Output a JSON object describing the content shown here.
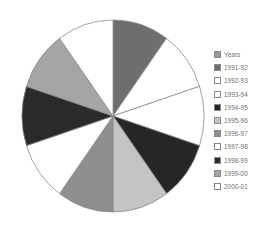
{
  "chart_data": {
    "type": "pie",
    "title": "",
    "legend_title": "Years",
    "legend_position": "right",
    "grid": false,
    "start_angle_deg": 0,
    "direction": "clockwise",
    "categories": [
      "1991-92",
      "1992-93",
      "1993-94",
      "1994-95",
      "1995-96",
      "1996-97",
      "1997-98",
      "1998-99",
      "1999-00",
      "2000-01"
    ],
    "values": [
      10,
      10,
      10,
      10,
      10,
      10,
      10,
      10,
      10,
      10
    ],
    "value_unit": "%",
    "slice_colors": [
      "#6e6e6e",
      "#ffffff",
      "#ffffff",
      "#262626",
      "#c4c4c4",
      "#8f8f8f",
      "#ffffff",
      "#2b2b2b",
      "#a5a5a5",
      "#ffffff"
    ],
    "slice_outline_color": "#8a8a8a",
    "slices": [
      {
        "label": "1991-92",
        "value": 10,
        "start_deg": 0,
        "end_deg": 36,
        "color": "#6e6e6e"
      },
      {
        "label": "1992-93",
        "value": 10,
        "start_deg": 36,
        "end_deg": 72,
        "color": "#ffffff"
      },
      {
        "label": "1993-94",
        "value": 10,
        "start_deg": 72,
        "end_deg": 108,
        "color": "#ffffff"
      },
      {
        "label": "1994-95",
        "value": 10,
        "start_deg": 108,
        "end_deg": 144,
        "color": "#262626"
      },
      {
        "label": "1995-96",
        "value": 10,
        "start_deg": 144,
        "end_deg": 180,
        "color": "#c4c4c4"
      },
      {
        "label": "1996-97",
        "value": 10,
        "start_deg": 180,
        "end_deg": 216,
        "color": "#8f8f8f"
      },
      {
        "label": "1997-98",
        "value": 10,
        "start_deg": 216,
        "end_deg": 252,
        "color": "#ffffff"
      },
      {
        "label": "1998-99",
        "value": 10,
        "start_deg": 252,
        "end_deg": 288,
        "color": "#2b2b2b"
      },
      {
        "label": "1999-00",
        "value": 10,
        "start_deg": 288,
        "end_deg": 324,
        "color": "#a5a5a5"
      },
      {
        "label": "2000-01",
        "value": 10,
        "start_deg": 324,
        "end_deg": 360,
        "color": "#ffffff"
      }
    ]
  },
  "legend": {
    "entries": [
      {
        "label": "Years",
        "color": "#9a9a9a"
      },
      {
        "label": "1991-92",
        "color": "#6e6e6e"
      },
      {
        "label": "1992-93",
        "color": "#ffffff"
      },
      {
        "label": "1993-94",
        "color": "#ffffff"
      },
      {
        "label": "1994-95",
        "color": "#262626"
      },
      {
        "label": "1995-96",
        "color": "#c4c4c4"
      },
      {
        "label": "1996-97",
        "color": "#8f8f8f"
      },
      {
        "label": "1997-98",
        "color": "#ffffff"
      },
      {
        "label": "1998-99",
        "color": "#2b2b2b"
      },
      {
        "label": "1999-00",
        "color": "#a5a5a5"
      },
      {
        "label": "2000-01",
        "color": "#ffffff"
      }
    ]
  }
}
